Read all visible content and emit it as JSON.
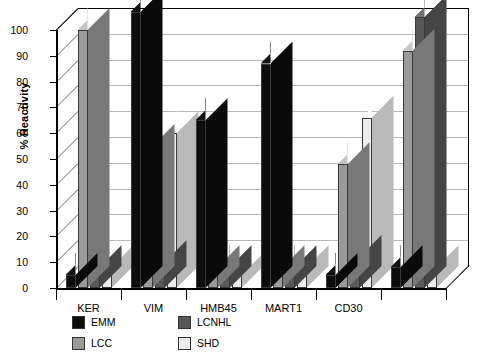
{
  "chart_data": {
    "type": "bar",
    "title": "",
    "xlabel": "",
    "ylabel": "% Reactivity",
    "ylim": [
      0,
      100
    ],
    "yticks": [
      0,
      10,
      20,
      30,
      40,
      50,
      60,
      70,
      80,
      90,
      100
    ],
    "ytick_labels": [
      "0",
      "10",
      "20",
      "30",
      "40",
      "50",
      "60",
      "70",
      "80",
      "90",
      "100"
    ],
    "grid": true,
    "legend_position": "bottom-left",
    "projection": "3d-grouped-columns",
    "categories": [
      "KER",
      "VIM",
      "HMB45",
      "MART1",
      "CD30",
      ""
    ],
    "series": [
      {
        "name": "EMM",
        "color": "#0d0d0d",
        "values": [
          5,
          107,
          65,
          87,
          5,
          8
        ]
      },
      {
        "name": "LCC",
        "color": "#9a9a9a",
        "values": [
          100,
          55,
          8,
          8,
          48,
          92
        ]
      },
      {
        "name": "LCNHL",
        "color": "#585858",
        "values": [
          8,
          10,
          8,
          8,
          12,
          105
        ]
      },
      {
        "name": "SHD",
        "color": "#ededed",
        "values": [
          8,
          60,
          5,
          8,
          66,
          8
        ]
      }
    ]
  },
  "legend": {
    "items": [
      {
        "label": "EMM",
        "swatch": "#0d0d0d"
      },
      {
        "label": "LCNHL",
        "swatch": "#585858"
      },
      {
        "label": "LCC",
        "swatch": "#9a9a9a"
      },
      {
        "label": "SHD",
        "swatch": "#ededed"
      }
    ]
  },
  "axis": {
    "y_title": "% Reactivity"
  }
}
